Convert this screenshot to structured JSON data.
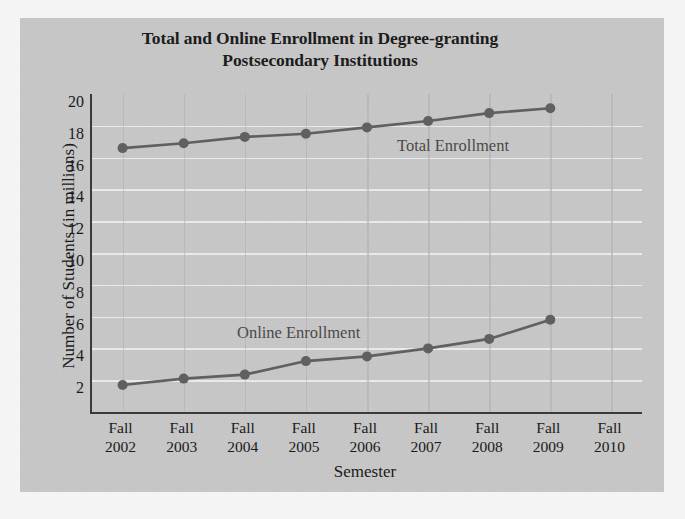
{
  "chart_data": {
    "type": "line",
    "title": "Total and Online Enrollment in Degree-granting Postsecondary Institutions",
    "title_line1": "Total and Online Enrollment in Degree-granting",
    "title_line2": "Postsecondary Institutions",
    "xlabel": "Semester",
    "ylabel": "Number of Students (in millions)",
    "categories": [
      "Fall 2002",
      "Fall 2003",
      "Fall 2004",
      "Fall 2005",
      "Fall 2006",
      "Fall 2007",
      "Fall 2008",
      "Fall 2009",
      "Fall 2010"
    ],
    "category_lines": [
      {
        "top": "Fall",
        "bottom": "2002"
      },
      {
        "top": "Fall",
        "bottom": "2003"
      },
      {
        "top": "Fall",
        "bottom": "2004"
      },
      {
        "top": "Fall",
        "bottom": "2005"
      },
      {
        "top": "Fall",
        "bottom": "2006"
      },
      {
        "top": "Fall",
        "bottom": "2007"
      },
      {
        "top": "Fall",
        "bottom": "2008"
      },
      {
        "top": "Fall",
        "bottom": "2009"
      },
      {
        "top": "Fall",
        "bottom": "2010"
      }
    ],
    "series": [
      {
        "name": "Total Enrollment",
        "label_text": "Total Enrollment",
        "color": "#606060",
        "values": [
          16.6,
          16.9,
          17.3,
          17.5,
          17.9,
          18.3,
          18.8,
          19.1,
          null
        ]
      },
      {
        "name": "Online Enrollment",
        "label_text": "Online Enrollment",
        "color": "#606060",
        "values": [
          1.7,
          2.1,
          2.35,
          3.2,
          3.5,
          4.0,
          4.6,
          5.8,
          null
        ]
      }
    ],
    "yticks": [
      20,
      18,
      16,
      14,
      12,
      10,
      8,
      6,
      4,
      2
    ],
    "ylim": [
      0,
      20
    ],
    "grid": true,
    "legend_position": "inline-annotations",
    "colors": {
      "panel": "#c9c9c9",
      "axis": "#3a3a3a",
      "gridline": "#efefef",
      "series": "#606060",
      "text": "#1a1a1a"
    }
  }
}
